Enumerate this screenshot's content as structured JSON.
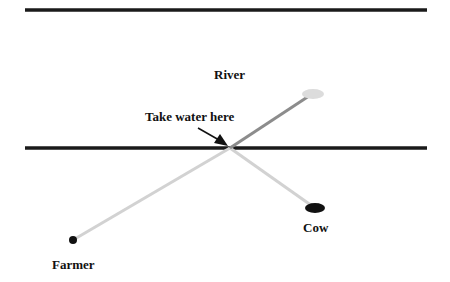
{
  "diagram": {
    "labels": {
      "river": "River",
      "take_water": "Take water here",
      "cow": "Cow",
      "farmer": "Farmer"
    },
    "colors": {
      "bank_line": "#1a1a1a",
      "river_path": "#8c8c8c",
      "land_path": "#d2d2d2",
      "water_point": "#dcdcdc",
      "node_dark": "#111111"
    },
    "geometry": {
      "top_bank": {
        "x1": 25,
        "y1": 10,
        "x2": 427,
        "y2": 10
      },
      "bottom_bank": {
        "x1": 25,
        "y1": 148,
        "x2": 427,
        "y2": 148
      },
      "crossing_point": {
        "x": 230,
        "y": 148
      },
      "water_point": {
        "x": 313,
        "y": 94
      },
      "farmer": {
        "x": 73,
        "y": 240
      },
      "cow": {
        "x": 315,
        "y": 208
      }
    }
  }
}
